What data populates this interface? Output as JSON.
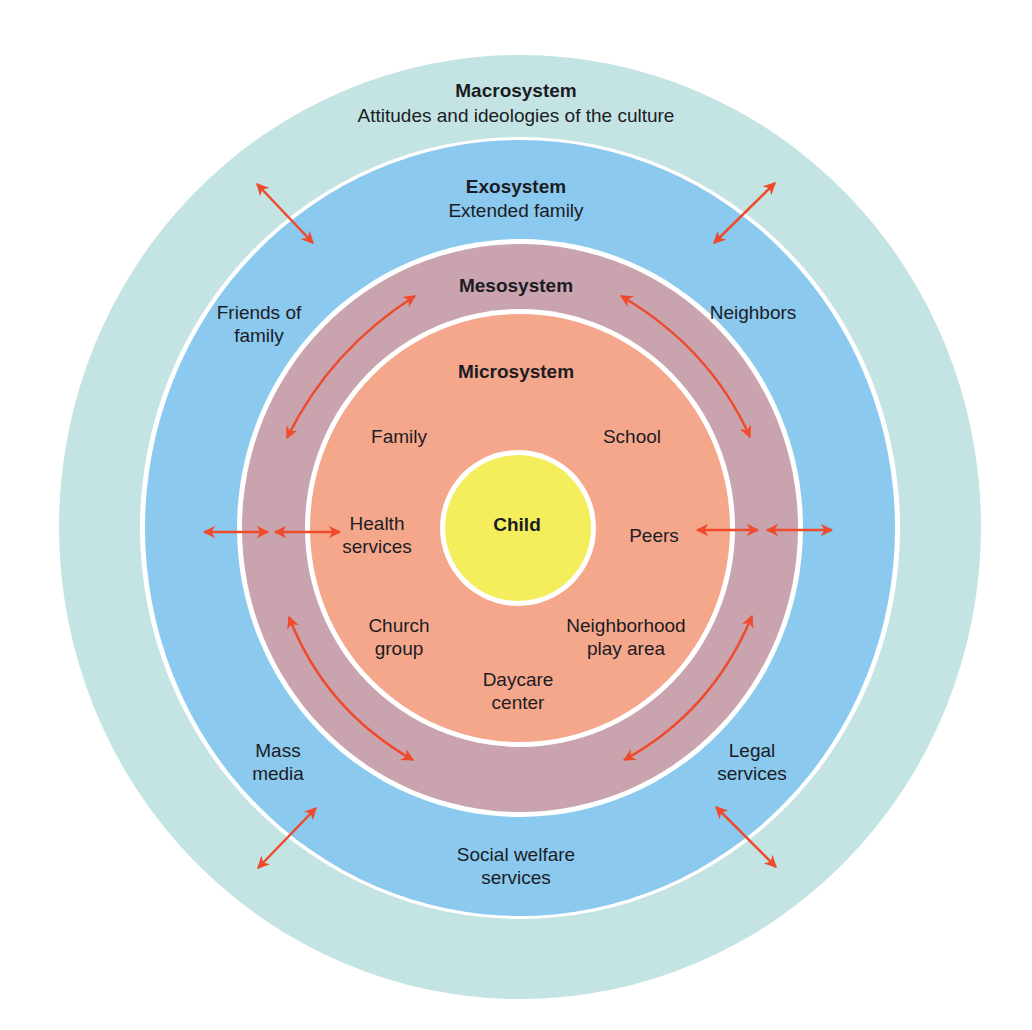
{
  "diagram": {
    "colors": {
      "macro": "#c3e4e2",
      "exo": "#8bc9ef",
      "meso": "#c9a4af",
      "micro": "#f5a78b",
      "child": "#f4ee5c",
      "separator": "#ffffff",
      "arrow": "#ef4a2b",
      "text": "#1c1c24"
    },
    "macrosystem": {
      "title": "Macrosystem",
      "subtitle": "Attitudes and ideologies of the culture"
    },
    "exosystem": {
      "title": "Exosystem",
      "items": [
        {
          "line1": "Extended family",
          "line2": ""
        },
        {
          "line1": "Friends of",
          "line2": "family"
        },
        {
          "line1": "Neighbors",
          "line2": ""
        },
        {
          "line1": "Mass",
          "line2": "media"
        },
        {
          "line1": "Legal",
          "line2": "services"
        },
        {
          "line1": "Social welfare",
          "line2": "services"
        }
      ]
    },
    "mesosystem": {
      "title": "Mesosystem"
    },
    "microsystem": {
      "title": "Microsystem",
      "items": [
        {
          "line1": "Family",
          "line2": ""
        },
        {
          "line1": "School",
          "line2": ""
        },
        {
          "line1": "Health",
          "line2": "services"
        },
        {
          "line1": "Peers",
          "line2": ""
        },
        {
          "line1": "Church",
          "line2": "group"
        },
        {
          "line1": "Neighborhood",
          "line2": "play area"
        },
        {
          "line1": "Daycare",
          "line2": "center"
        }
      ]
    },
    "center": {
      "label": "Child"
    }
  }
}
